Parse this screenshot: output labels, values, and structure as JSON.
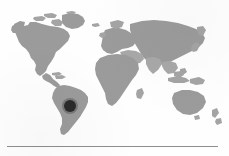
{
  "figure": {
    "kind": "world-map-locator",
    "title": "",
    "caption": "",
    "background_color": "#fefefe",
    "land_color": "#9b9b9b",
    "ocean_color": "#ffffff",
    "marker_color": "#2b2b2b",
    "rule_color": "#8e8e8e"
  },
  "map": {
    "projection_note": "equirectangular-like world outline",
    "regions": [
      "North America",
      "South America",
      "Europe",
      "Africa",
      "Asia",
      "Australia",
      "New Zealand",
      "Greenland",
      "Indonesia",
      "Japan",
      "Madagascar",
      "United Kingdom",
      "Caribbean"
    ]
  },
  "marker": {
    "label": "",
    "region": "South America",
    "cx": 70,
    "cy": 106,
    "r": 6,
    "color": "#2b2b2b"
  },
  "rule": {
    "x": 7,
    "y": 146,
    "width": 211,
    "thickness": 1
  }
}
